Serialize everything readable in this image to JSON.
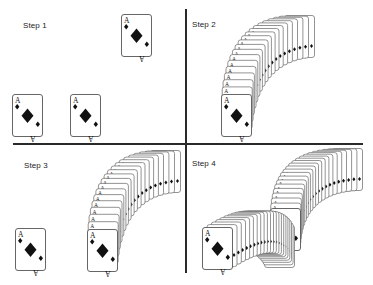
{
  "figure": {
    "panels": [
      {
        "id": "step-1",
        "label": "Step 1",
        "label_pos": [
          23,
          22
        ]
      },
      {
        "id": "step-2",
        "label": "Step 2",
        "label_pos": [
          192,
          21
        ]
      },
      {
        "id": "step-3",
        "label": "Step 3",
        "label_pos": [
          24,
          162
        ]
      },
      {
        "id": "step-4",
        "label": "Step 4",
        "label_pos": [
          192,
          160
        ]
      }
    ],
    "card": {
      "rank": "A",
      "suit": "diamond",
      "suit_glyph": "♦",
      "width": 31,
      "height": 43,
      "border_color": "#555555",
      "fill_color": "#ffffff",
      "pip_color": "#111111"
    },
    "dividers": {
      "color": "#2a2a2a"
    },
    "single_cards": [
      {
        "panel": "step-1",
        "x": 121,
        "y": 14
      },
      {
        "panel": "step-1",
        "x": 12,
        "y": 94
      },
      {
        "panel": "step-1",
        "x": 70,
        "y": 94
      },
      {
        "panel": "step-3",
        "x": 15,
        "y": 228
      }
    ],
    "fans": [
      {
        "panel": "step-2",
        "count": 20,
        "start": [
          221,
          94
        ],
        "ctrl": [
          226,
          20
        ],
        "end": [
          284,
          15
        ],
        "direction": "up-right"
      },
      {
        "panel": "step-3",
        "count": 20,
        "start": [
          87,
          229
        ],
        "ctrl": [
          92,
          153
        ],
        "end": [
          150,
          150
        ],
        "direction": "up-right"
      },
      {
        "panel": "step-4",
        "count": 22,
        "start": [
          270,
          208
        ],
        "ctrl": [
          272,
          150
        ],
        "end": [
          332,
          148
        ],
        "direction": "up-right"
      },
      {
        "panel": "step-4",
        "count": 22,
        "start": [
          202,
          227
        ],
        "ctrl": [
          250,
          195
        ],
        "end": [
          264,
          225
        ],
        "direction": "arch"
      }
    ]
  }
}
